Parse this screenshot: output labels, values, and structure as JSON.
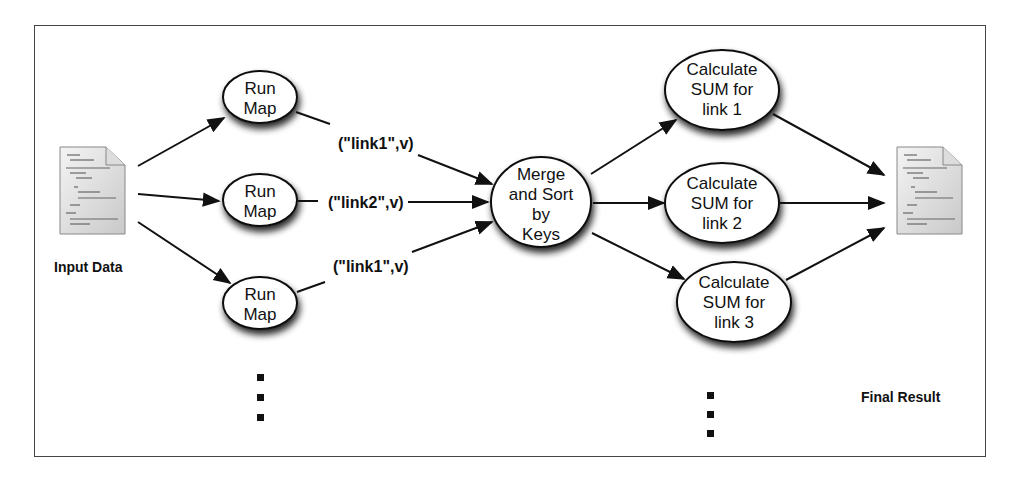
{
  "diagram": {
    "input": {
      "label": "Input Data",
      "icon": "document-icon"
    },
    "output": {
      "label": "Final Result",
      "icon": "document-icon"
    },
    "map_nodes": [
      {
        "line1": "Run",
        "line2": "Map",
        "emit": "(\"link1\",v)"
      },
      {
        "line1": "Run",
        "line2": "Map",
        "emit": "(\"link2\",v)"
      },
      {
        "line1": "Run",
        "line2": "Map",
        "emit": "(\"link1\",v)"
      }
    ],
    "merge_node": {
      "line1": "Merge",
      "line2": "and Sort",
      "line3": "by",
      "line4": "Keys"
    },
    "reduce_nodes": [
      {
        "line1": "Calculate",
        "line2": "SUM for",
        "line3": "link 1"
      },
      {
        "line1": "Calculate",
        "line2": "SUM for",
        "line3": "link 2"
      },
      {
        "line1": "Calculate",
        "line2": "SUM for",
        "line3": "link 3"
      }
    ],
    "ellipsis": "more nodes"
  }
}
